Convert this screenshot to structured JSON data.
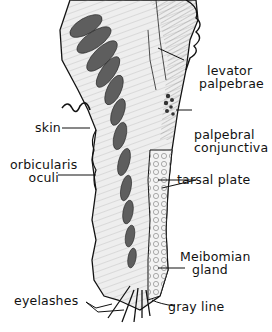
{
  "figure": {
    "colors": {
      "ink": "#111111",
      "background": "#ffffff",
      "muscle_fill": "#6f6f6f",
      "tissue_fill": "#e6e6e6"
    }
  },
  "labels": {
    "levator_1": "levator",
    "levator_2": "palpebrae",
    "palpebral_1": "palpebral",
    "palpebral_2": "conjunctiva",
    "skin": "skin",
    "orbicularis_1": "orbicularis",
    "orbicularis_2": "oculi",
    "tarsal": "tarsal plate",
    "meibomian_1": "Meibomian",
    "meibomian_2": "gland",
    "eyelashes": "eyelashes",
    "gray_line": "gray line"
  }
}
